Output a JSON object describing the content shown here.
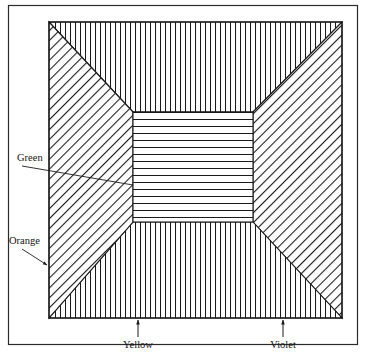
{
  "figure": {
    "background_color": "#ffffff",
    "ink_color": "#1a1a1a",
    "outer_frame": {
      "x": 8,
      "y": 5,
      "width": 350,
      "height": 340
    },
    "plate": {
      "x": 49,
      "y": 22,
      "width": 293,
      "height": 296
    },
    "center_square": {
      "x": 133,
      "y": 112,
      "width": 120,
      "height": 110
    }
  },
  "regions": [
    {
      "id": "top-panel",
      "name": "top-trapezoid-region",
      "hatch": "vertical",
      "label": ""
    },
    {
      "id": "left-panel",
      "name": "left-trapezoid-region",
      "hatch": "diagonal-up",
      "label": "Orange"
    },
    {
      "id": "bottom-panel",
      "name": "bottom-trapezoid-region",
      "hatch": "vertical",
      "label": "Yellow"
    },
    {
      "id": "right-panel",
      "name": "right-trapezoid-region",
      "hatch": "diagonal-up",
      "label": "Violet"
    },
    {
      "id": "center-square",
      "name": "center-square-region",
      "hatch": "horizontal",
      "label": "Green"
    }
  ],
  "labels": {
    "green": {
      "text": "Green",
      "x": 17,
      "y": 161,
      "leader": {
        "x1": 22,
        "y1": 166,
        "x2": 133,
        "y2": 185
      },
      "marker": "line"
    },
    "orange": {
      "text": "Orange",
      "x": 9,
      "y": 246,
      "leader": {
        "x1": 22,
        "y1": 250,
        "x2": 48,
        "y2": 266
      },
      "marker": "arrow"
    },
    "yellow": {
      "text": "Yellow",
      "x": 120,
      "y": 345,
      "leader": {
        "x1": 138,
        "y1": 336,
        "x2": 138,
        "y2": 319
      },
      "marker": "arrow-up"
    },
    "violet": {
      "text": "Violet",
      "x": 268,
      "y": 345,
      "leader": {
        "x1": 283,
        "y1": 336,
        "x2": 283,
        "y2": 319
      },
      "marker": "arrow-up"
    }
  },
  "hatching": {
    "vertical_spacing_px": 5,
    "horizontal_spacing_px": 7,
    "diagonal_spacing_px": 7,
    "stroke_width_px": 1,
    "diagonal_angle_deg": 45
  }
}
